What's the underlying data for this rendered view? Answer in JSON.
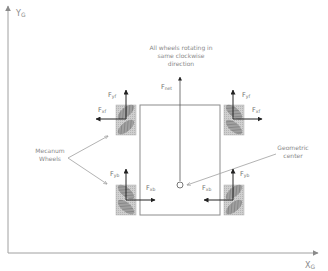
{
  "axes": {
    "y_label": "Y",
    "y_subscript": "G",
    "x_label": "X",
    "x_subscript": "G"
  },
  "annotation_top": {
    "line1": "All wheels rotating in",
    "line2": "same clockwise",
    "line3": "direction"
  },
  "net_force": {
    "label": "F",
    "subscript": "net"
  },
  "mecanum_label": {
    "line1": "Mecanum",
    "line2": "Wheels"
  },
  "center_label": {
    "line1": "Geometric",
    "line2": "center"
  },
  "wheels": {
    "front_left": {
      "fy_label": "F",
      "fy_sub": "yf",
      "fx_label": "F",
      "fx_sub": "xf"
    },
    "front_right": {
      "fy_label": "F",
      "fy_sub": "yf",
      "fx_label": "F",
      "fx_sub": "xf"
    },
    "rear_left": {
      "fy_label": "F",
      "fy_sub": "yb",
      "fx_label": "F",
      "fx_sub": "xb"
    },
    "rear_right": {
      "fy_label": "F",
      "fy_sub": "yb",
      "fx_label": "F",
      "fx_sub": "xb"
    }
  },
  "colors": {
    "axis": "#9a9a9a",
    "chassis": "#8c8c8c",
    "arrow": "#222222",
    "wheel_fill": "#c8c8c8",
    "roller_fill": "#8f8f8f",
    "text": "#8a8a8a"
  }
}
